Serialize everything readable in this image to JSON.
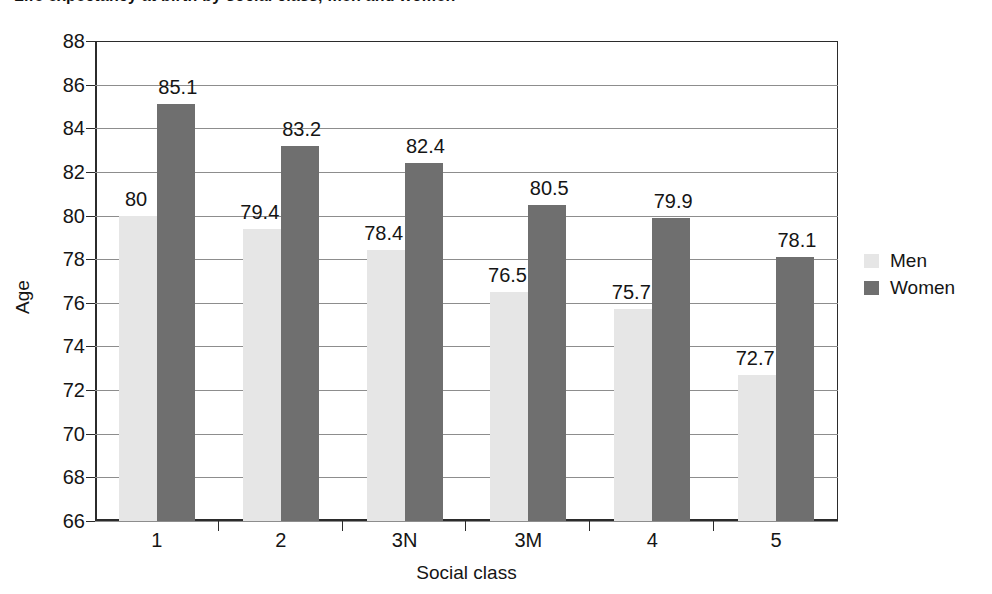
{
  "chart_data": {
    "type": "bar",
    "title": "Life expectancy at birth by social class, men and women",
    "xlabel": "Social class",
    "ylabel": "Age",
    "ylim": [
      66,
      88
    ],
    "ytick_step": 2,
    "yticks": [
      88,
      86,
      84,
      82,
      80,
      78,
      76,
      74,
      72,
      70,
      68,
      66
    ],
    "categories": [
      "1",
      "2",
      "3N",
      "3M",
      "4",
      "5"
    ],
    "grid": true,
    "legend_position": "right",
    "series": [
      {
        "name": "Men",
        "color": "#e6e6e6",
        "values": [
          80,
          79.4,
          78.4,
          76.5,
          75.7,
          72.7
        ],
        "labels": [
          "80",
          "79.4",
          "78.4",
          "76.5",
          "75.7",
          "72.7"
        ]
      },
      {
        "name": "Women",
        "color": "#6f6f6f",
        "values": [
          85.1,
          83.2,
          82.4,
          80.5,
          79.9,
          78.1
        ],
        "labels": [
          "85.1",
          "83.2",
          "82.4",
          "80.5",
          "79.9",
          "78.1"
        ]
      }
    ]
  },
  "legend": {
    "items": [
      {
        "label": "Men",
        "color": "#e6e6e6"
      },
      {
        "label": "Women",
        "color": "#6f6f6f"
      }
    ]
  }
}
